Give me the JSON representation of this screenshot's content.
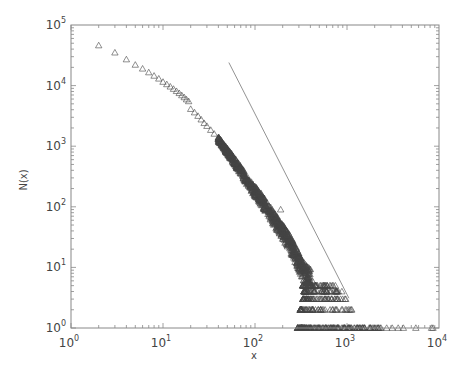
{
  "chart_data": {
    "type": "scatter",
    "title": "",
    "xlabel": "x",
    "ylabel": "N(x)",
    "xscale": "log",
    "yscale": "log",
    "xlim": [
      1,
      10000
    ],
    "ylim": [
      1,
      100000
    ],
    "grid": false,
    "legend": null,
    "marker": "open-triangle",
    "x_ticks": [
      {
        "base": "10",
        "exp": "0"
      },
      {
        "base": "10",
        "exp": "1"
      },
      {
        "base": "10",
        "exp": "2"
      },
      {
        "base": "10",
        "exp": "3"
      },
      {
        "base": "10",
        "exp": "4"
      }
    ],
    "y_ticks": [
      {
        "base": "10",
        "exp": "0"
      },
      {
        "base": "10",
        "exp": "1"
      },
      {
        "base": "10",
        "exp": "2"
      },
      {
        "base": "10",
        "exp": "3"
      },
      {
        "base": "10",
        "exp": "4"
      },
      {
        "base": "10",
        "exp": "5"
      }
    ],
    "series": [
      {
        "name": "N(x)",
        "points": [
          [
            2,
            46000
          ],
          [
            3,
            35000
          ],
          [
            4,
            27000
          ],
          [
            5,
            22000
          ],
          [
            6,
            19000
          ],
          [
            7,
            16500
          ],
          [
            8,
            14500
          ],
          [
            9,
            13000
          ],
          [
            10,
            11500
          ],
          [
            11,
            10500
          ],
          [
            12,
            9600
          ],
          [
            13,
            8800
          ],
          [
            14,
            8100
          ],
          [
            15,
            7500
          ],
          [
            16,
            6900
          ],
          [
            17,
            6400
          ],
          [
            18,
            5900
          ],
          [
            19,
            5500
          ],
          [
            20,
            4100
          ],
          [
            22,
            3600
          ],
          [
            24,
            3150
          ],
          [
            26,
            2750
          ],
          [
            28,
            2400
          ],
          [
            30,
            2150
          ],
          [
            33,
            1850
          ],
          [
            36,
            1600
          ],
          [
            40,
            1300
          ],
          [
            44,
            1080
          ],
          [
            48,
            900
          ],
          [
            52,
            760
          ],
          [
            56,
            650
          ],
          [
            60,
            560
          ],
          [
            65,
            470
          ],
          [
            70,
            400
          ],
          [
            75,
            340
          ],
          [
            80,
            290
          ],
          [
            85,
            250
          ],
          [
            90,
            220
          ],
          [
            100,
            180
          ],
          [
            110,
            150
          ],
          [
            120,
            125
          ],
          [
            130,
            105
          ],
          [
            140,
            88
          ],
          [
            150,
            75
          ],
          [
            160,
            64
          ],
          [
            170,
            56
          ],
          [
            180,
            48
          ],
          [
            190,
            44
          ],
          [
            200,
            38
          ],
          [
            215,
            33
          ],
          [
            230,
            28
          ],
          [
            250,
            22
          ],
          [
            270,
            17
          ],
          [
            290,
            14
          ],
          [
            310,
            11
          ],
          [
            330,
            9
          ],
          [
            350,
            8
          ],
          [
            380,
            7
          ],
          [
            420,
            6
          ],
          [
            460,
            5
          ],
          [
            190,
            90
          ]
        ],
        "scatter_band": {
          "description": "dense noisy band around the curve for 40 < x < 400",
          "x_range": [
            40,
            400
          ]
        },
        "integer_rows": [
          {
            "N": 5,
            "x_from": 330,
            "x_to": 780
          },
          {
            "N": 4,
            "x_from": 340,
            "x_to": 900
          },
          {
            "N": 3,
            "x_from": 330,
            "x_to": 1000
          },
          {
            "N": 2,
            "x_from": 310,
            "x_to": 1200
          },
          {
            "N": 1,
            "x_from": 290,
            "x_to": 2400
          }
        ],
        "sparse_tail_N1": [
          2700,
          3100,
          3600,
          4100,
          5600,
          8300,
          8600
        ]
      }
    ],
    "reference_line": {
      "description": "power-law guide line, slope approx -3",
      "slope": -3.0,
      "x_start": 52,
      "y_start": 24000,
      "x_end": 1050,
      "y_end": 3.1
    }
  }
}
